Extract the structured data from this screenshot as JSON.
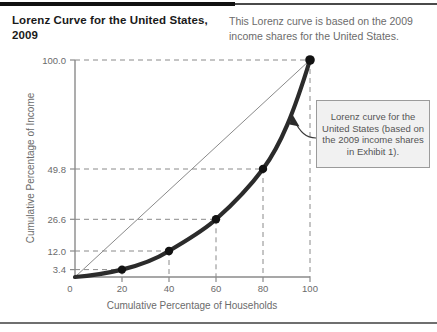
{
  "figure": {
    "title": "Lorenz Curve for the United States, 2009",
    "caption": "This Lorenz curve is based on the 2009 income shares for the United States.",
    "callout": "Lorenz curve for the United States (based on the 2009 income shares in Exhibit 1).",
    "colors": {
      "curve": "#2b2b2b",
      "equality_line": "#8a8a8a",
      "gridline": "#8a8a8a",
      "axis": "#8a8a8a",
      "text_muted": "#6b6b6b",
      "title": "#1a1a1a",
      "callout_fill": "#f1f1f1",
      "callout_border": "#9b9b9b",
      "rule_dark": "#111111"
    }
  },
  "chart_data": {
    "type": "line",
    "title": "Lorenz Curve for the United States, 2009",
    "xlabel": "Cumulative Percentage of Households",
    "ylabel": "Cumulative Percentage of Income",
    "xlim": [
      0,
      100
    ],
    "ylim": [
      0,
      100
    ],
    "grid": "dashed-guides",
    "legend": "none",
    "xticks": [
      0,
      20,
      40,
      60,
      80,
      100
    ],
    "xtick_labels": [
      "0",
      "20",
      "40",
      "60",
      "80",
      "100"
    ],
    "yticks": [
      0,
      3.4,
      12.0,
      26.6,
      49.8,
      100.0
    ],
    "ytick_labels": [
      "0",
      "3.4",
      "12.0",
      "26.6",
      "49.8",
      "100.0"
    ],
    "series": [
      {
        "name": "Lorenz curve",
        "style": "thick-solid-with-markers",
        "x": [
          0,
          20,
          40,
          60,
          80,
          100
        ],
        "y": [
          0,
          3.4,
          12.0,
          26.6,
          49.8,
          100.0
        ]
      },
      {
        "name": "Line of equality",
        "style": "thin-solid",
        "x": [
          0,
          100
        ],
        "y": [
          0,
          100
        ]
      }
    ],
    "annotations": [
      {
        "text": "Lorenz curve for the United States (based on the 2009 income shares in Exhibit 1).",
        "points_to": [
          94,
          84
        ]
      }
    ]
  }
}
